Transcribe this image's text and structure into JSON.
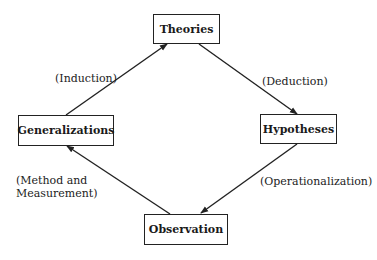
{
  "diagram": {
    "nodes": {
      "theories": "Theories",
      "hypotheses": "Hypotheses",
      "observation": "Observation",
      "generalizations": "Generalizations"
    },
    "edges": [
      {
        "from": "generalizations",
        "to": "theories",
        "label": "(Induction)"
      },
      {
        "from": "theories",
        "to": "hypotheses",
        "label": "(Deduction)"
      },
      {
        "from": "hypotheses",
        "to": "observation",
        "label": "(Operationalization)"
      },
      {
        "from": "observation",
        "to": "generalizations",
        "label_line1": "(Method and",
        "label_line2": "Measurement)"
      }
    ],
    "line_color": "#222222"
  }
}
